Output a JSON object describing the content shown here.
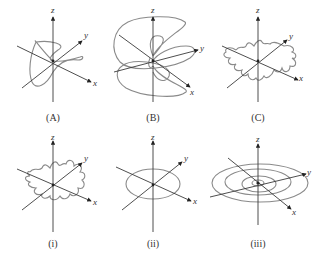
{
  "panels": [
    {
      "id": "A",
      "caption": "(A)",
      "axis_labels": {
        "x": "x",
        "y": "y",
        "z": "z"
      },
      "description": "closed twisted 3D curve"
    },
    {
      "id": "B",
      "caption": "(B)",
      "axis_labels": {
        "x": "x",
        "y": "y",
        "z": "z"
      },
      "description": "multi-lobed looping curve around z-axis"
    },
    {
      "id": "C",
      "caption": "(C)",
      "axis_labels": {
        "x": "x",
        "y": "y",
        "z": "z"
      },
      "description": "wavy closed curve with small loops"
    },
    {
      "id": "i",
      "caption": "(i)",
      "axis_labels": {
        "x": "x",
        "y": "y",
        "z": "z"
      },
      "description": "wavy closed curve in plane"
    },
    {
      "id": "ii",
      "caption": "(ii)",
      "axis_labels": {
        "x": "x",
        "y": "y",
        "z": "z"
      },
      "description": "ellipse in xy-plane"
    },
    {
      "id": "iii",
      "caption": "(iii)",
      "axis_labels": {
        "x": "x",
        "y": "y",
        "z": "z"
      },
      "description": "spiral of nested ellipses in xy-plane"
    }
  ],
  "colors": {
    "axis": "#3a3a3a",
    "curve": "#8a8a8a",
    "background": "#ffffff"
  }
}
